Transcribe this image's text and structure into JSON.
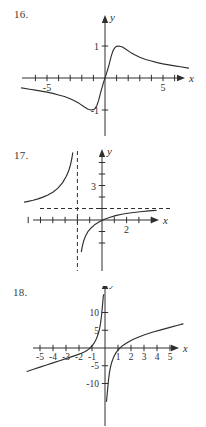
{
  "page": {
    "background_color": "#ffffff",
    "ink_color": "#2f2f2f",
    "width": 206,
    "height": 427
  },
  "problems": [
    {
      "number_label": "16.",
      "axis_label_x": "x",
      "axis_label_y": "y",
      "x_tick_labels": [
        "-5",
        "5"
      ],
      "y_tick_labels": [
        "1",
        "-1"
      ],
      "chart_data": {
        "type": "line",
        "title": "",
        "xlabel": "x",
        "ylabel": "y",
        "xlim": [
          -7.5,
          7.5
        ],
        "ylim": [
          -1.6,
          1.6
        ],
        "grid": false,
        "legend": "none",
        "x_ticks": [
          -6,
          -5,
          -4,
          -3,
          -2,
          -1,
          1,
          2,
          3,
          4,
          5,
          6
        ],
        "y_ticks": [
          -1,
          1
        ],
        "labeled_x_ticks": [
          -5,
          5
        ],
        "labeled_y_ticks": [
          1,
          -1
        ],
        "annotations": [
          "odd function",
          "local max near y=1 just right of origin",
          "local min near y=-1 just left of origin",
          "approaches 0 as x goes to plus or minus infinity"
        ],
        "series": [
          {
            "name": "curve-16",
            "x": [
              -7.2,
              -6.5,
              -6.0,
              -5.5,
              -5.0,
              -4.5,
              -4.0,
              -3.5,
              -3.0,
              -2.6,
              -2.2,
              -1.8,
              -1.5,
              -1.2,
              -1.0,
              -0.85,
              -0.7,
              -0.55,
              -0.45,
              -0.35,
              -0.25,
              -0.15,
              -0.05,
              0,
              0.05,
              0.15,
              0.25,
              0.35,
              0.45,
              0.55,
              0.7,
              0.85,
              1.0,
              1.2,
              1.5,
              1.8,
              2.2,
              2.6,
              3.0,
              3.5,
              4.0,
              4.5,
              5.0,
              5.5,
              6.0,
              6.5,
              7.2
            ],
            "y": [
              -0.31,
              -0.35,
              -0.38,
              -0.41,
              -0.44,
              -0.48,
              -0.53,
              -0.58,
              -0.65,
              -0.72,
              -0.8,
              -0.9,
              -0.97,
              -1.0,
              -0.99,
              -0.95,
              -0.86,
              -0.7,
              -0.56,
              -0.42,
              -0.29,
              -0.17,
              -0.05,
              0,
              0.05,
              0.17,
              0.29,
              0.42,
              0.56,
              0.7,
              0.86,
              0.95,
              0.99,
              1.0,
              0.97,
              0.9,
              0.8,
              0.72,
              0.65,
              0.58,
              0.53,
              0.48,
              0.44,
              0.41,
              0.38,
              0.35,
              0.31
            ]
          }
        ]
      }
    },
    {
      "number_label": "17.",
      "axis_label_x": "x",
      "axis_label_y": "y",
      "x_tick_labels": [
        "2"
      ],
      "y_tick_labels": [
        "3"
      ],
      "chart_data": {
        "type": "line",
        "title": "",
        "xlabel": "x",
        "ylabel": "y",
        "xlim": [
          -6.5,
          5.0
        ],
        "ylim": [
          -3.0,
          6.2
        ],
        "grid": false,
        "legend": "none",
        "x_ticks": [
          -6,
          -5,
          -4,
          -3,
          -2,
          -1,
          1,
          2,
          3,
          4
        ],
        "y_ticks": [
          -2,
          -1,
          1,
          2,
          3,
          4,
          5
        ],
        "labeled_x_ticks": [
          2
        ],
        "labeled_y_ticks": [
          3
        ],
        "asymptotes": {
          "vertical_dashed_x": -2,
          "horizontal_dashed_y": 1
        },
        "annotations": [
          "rational/log-like curve with vertical dashed asymptote at x = -2",
          "horizontal dashed asymptote at y = 1",
          "left branch decreasing above asymptote",
          "right branch rising from below toward y = 1",
          "x-intercept near x = 1.3"
        ],
        "series": [
          {
            "name": "left-branch-17",
            "x": [
              -6.3,
              -6.0,
              -5.6,
              -5.2,
              -4.8,
              -4.4,
              -4.0,
              -3.6,
              -3.2,
              -2.9,
              -2.7,
              -2.55,
              -2.45,
              -2.38
            ],
            "y": [
              1.55,
              1.62,
              1.72,
              1.84,
              1.99,
              2.18,
              2.42,
              2.75,
              3.25,
              3.8,
              4.3,
              4.85,
              5.35,
              5.85
            ]
          },
          {
            "name": "right-branch-17",
            "x": [
              -1.68,
              -1.6,
              -1.5,
              -1.35,
              -1.15,
              -0.9,
              -0.6,
              -0.25,
              0.15,
              0.6,
              1.1,
              1.7,
              2.4,
              3.1,
              3.8,
              4.4
            ],
            "y": [
              -2.75,
              -2.3,
              -1.85,
              -1.42,
              -1.02,
              -0.7,
              -0.42,
              -0.18,
              0.04,
              0.22,
              0.38,
              0.52,
              0.63,
              0.72,
              0.79,
              0.84
            ]
          }
        ]
      }
    },
    {
      "number_label": "18.",
      "axis_label_x": "x",
      "axis_label_y": "y",
      "x_tick_labels": [
        "-5",
        "-4",
        "-3",
        "-2",
        "-1",
        "1",
        "2",
        "3",
        "4",
        "5"
      ],
      "y_tick_labels": [
        "10",
        "5",
        "-5",
        "-10"
      ],
      "chart_data": {
        "type": "line",
        "title": "",
        "xlabel": "x",
        "ylabel": "y",
        "xlim": [
          -6.2,
          6.2
        ],
        "ylim": [
          -15.0,
          15.0
        ],
        "grid": false,
        "legend": "none",
        "x_ticks": [
          -5,
          -4,
          -3,
          -2,
          -1,
          1,
          2,
          3,
          4,
          5
        ],
        "y_ticks": [
          -10,
          -5,
          5,
          10
        ],
        "labeled_x_ticks": [
          -5,
          -4,
          -3,
          -2,
          -1,
          1,
          2,
          3,
          4,
          5
        ],
        "labeled_y_ticks": [
          10,
          5,
          -5,
          -10
        ],
        "asymptotes": {
          "vertical_x": 0,
          "slant_line": "y = x"
        },
        "annotations": [
          "function with vertical asymptote at x = 0",
          "slant asymptote approximately y = x + 1 on both ends",
          "branch left of origin rises to +infinity as x approaches 0 from the left",
          "branch right of origin comes from -infinity as x approaches 0 from the right"
        ],
        "series": [
          {
            "name": "left-branch-18",
            "x": [
              -6.0,
              -5.5,
              -5.0,
              -4.5,
              -4.0,
              -3.5,
              -3.0,
              -2.6,
              -2.2,
              -1.9,
              -1.6,
              -1.35,
              -1.15,
              -0.95,
              -0.8,
              -0.65,
              -0.52,
              -0.42,
              -0.34,
              -0.27,
              -0.21,
              -0.16,
              -0.12,
              -0.09
            ],
            "y": [
              -6.6,
              -6.0,
              -5.4,
              -4.8,
              -4.2,
              -3.6,
              -3.0,
              -2.5,
              -2.0,
              -1.6,
              -1.1,
              -0.6,
              0.0,
              0.8,
              1.6,
              2.7,
              4.0,
              5.4,
              7.0,
              9.0,
              11.3,
              13.3,
              15.0,
              15.0
            ]
          },
          {
            "name": "right-branch-18",
            "x": [
              0.09,
              0.12,
              0.16,
              0.21,
              0.27,
              0.34,
              0.42,
              0.52,
              0.65,
              0.8,
              0.95,
              1.15,
              1.4,
              1.7,
              2.1,
              2.6,
              3.1,
              3.7,
              4.3,
              5.0,
              5.6,
              6.0
            ],
            "y": [
              -15.0,
              -15.0,
              -13.3,
              -11.3,
              -9.0,
              -7.0,
              -5.4,
              -4.0,
              -2.7,
              -1.6,
              -0.8,
              0.0,
              0.8,
              1.5,
              2.3,
              3.1,
              3.8,
              4.5,
              5.1,
              5.8,
              6.4,
              6.8
            ]
          }
        ]
      }
    }
  ]
}
